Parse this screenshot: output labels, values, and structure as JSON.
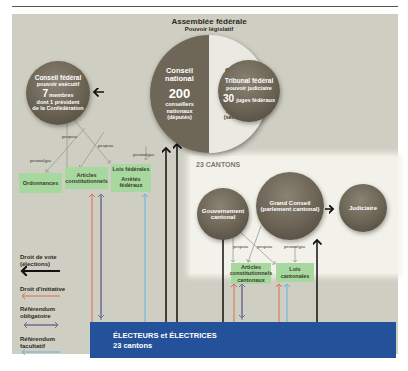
{
  "header": {
    "running_title": ""
  },
  "federal": {
    "assembly_title": "Assemblée fédérale",
    "assembly_subtitle": "Pouvoir législatif",
    "conseil_national": {
      "name_1": "Conseil",
      "name_2": "national",
      "count": "200",
      "desc_1": "conseillers",
      "desc_2": "nationaux",
      "desc_3": "(députés)"
    },
    "conseil_etats": {
      "name_1": "Conseil",
      "name_2": "des États",
      "count": "46",
      "desc_1": "conseillers",
      "desc_2": "aux États",
      "desc_3": "(sénateurs)"
    },
    "conseil_federal": {
      "name": "Conseil fédéral",
      "role": "pouvoir exécutif",
      "count": "7",
      "count_label": "membres",
      "desc_1": "dont 1 président",
      "desc_2": "de la Confédération"
    },
    "tribunal": {
      "name": "Tribunal fédéral",
      "role": "pouvoir judiciaire",
      "count": "30",
      "count_label": "juges fédéraux"
    },
    "labels": {
      "propose_1": "propose",
      "propose_2": "propose",
      "promulgue_1": "promulgue",
      "promulgue_2": "promulgue"
    },
    "boxes": {
      "ordonnances": "Ordonnances",
      "articles_1": "Articles",
      "articles_2": "constitutionnels",
      "lois": "Lois fédérales",
      "arretes_1": "Arrêtés",
      "arretes_2": "fédéraux"
    }
  },
  "cantons": {
    "title": "23 CANTONS",
    "gouvernement_1": "Gouvernement",
    "gouvernement_2": "cantonal",
    "grand_conseil_1": "Grand Conseil",
    "grand_conseil_2": "(parlement cantonal)",
    "judiciaire": "Judiciaire",
    "labels": {
      "propose_1": "propose",
      "propose_2": "propose",
      "promulgue": "promulgue"
    },
    "boxes": {
      "articles_1": "Articles",
      "articles_2": "constitutionnels",
      "articles_3": "cantonaux",
      "lois_1": "Lois",
      "lois_2": "cantonales"
    }
  },
  "voters": {
    "line_1": "ÉLECTEURS et ÉLECTRICES",
    "line_2": "23 cantons"
  },
  "legend": [
    {
      "label_1": "Droit de vote",
      "label_2": "(élections)",
      "color": "#111111"
    },
    {
      "label_1": "Droit d'initiative",
      "label_2": "",
      "color": "#e06a4e"
    },
    {
      "label_1": "Référendum",
      "label_2": "obligatoire",
      "color": "#6f6d8e"
    },
    {
      "label_1": "Référendum",
      "label_2": "facultatif",
      "color": "#5fb3e0"
    }
  ],
  "colors": {
    "panel": "#cfcec2",
    "circle": "#6a6354",
    "green": "#a7d8a0",
    "voters": "#23529a"
  }
}
